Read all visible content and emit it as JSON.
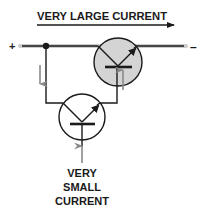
{
  "diagram": {
    "title": "VERY LARGE CURRENT",
    "terminals": {
      "positive": "+",
      "negative": "–"
    },
    "bottom_label": {
      "line1": "VERY",
      "line2": "SMALL",
      "line3": "CURRENT"
    },
    "components": [
      {
        "name": "large-transistor",
        "type": "NPN transistor",
        "fill": "#d4d4d4"
      },
      {
        "name": "small-transistor",
        "type": "NPN transistor",
        "fill": "#ffffff"
      }
    ],
    "colors": {
      "wire": "#1a1a1a",
      "main_wire_glow": "#cccccc",
      "current_arrow": "#8a8a8a",
      "large_transistor_fill": "#d4d4d4",
      "text": "#1a1a1a"
    }
  }
}
